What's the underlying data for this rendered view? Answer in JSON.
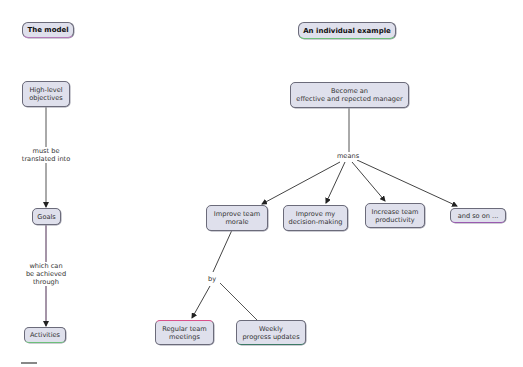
{
  "diagram": {
    "type": "concept-map",
    "sections": {
      "model": {
        "title": "The model"
      },
      "example": {
        "title": "An individual example"
      }
    },
    "nodes": {
      "high_level_objectives": "High-level\nobjectives",
      "goals": "Goals",
      "activities": "Activities",
      "root_goal": "Become an\neffective and repected manager",
      "improve_morale": "Improve team\nmorale",
      "improve_decision": "Improve my\ndecision-making",
      "increase_productivity": "Increase team\nproductivity",
      "and_so_on": "and so on ...",
      "regular_meetings": "Regular team\nmeetings",
      "weekly_updates": "Weekly\nprogress updates"
    },
    "linking_phrases": {
      "translated": "must be\ntranslated into",
      "achieved": "which can\nbe achieved\nthrough",
      "means": "means",
      "by": "by"
    },
    "edges": [
      {
        "from": "High-level objectives",
        "label": "must be translated into",
        "to": "Goals"
      },
      {
        "from": "Goals",
        "label": "which can be achieved through",
        "to": "Activities"
      },
      {
        "from": "Become an effective and repected manager",
        "label": "means",
        "to": "Improve team morale"
      },
      {
        "from": "Become an effective and repected manager",
        "label": "means",
        "to": "Improve my decision-making"
      },
      {
        "from": "Become an effective and repected manager",
        "label": "means",
        "to": "Increase team productivity"
      },
      {
        "from": "Become an effective and repected manager",
        "label": "means",
        "to": "and so on ..."
      },
      {
        "from": "Improve team morale",
        "label": "by",
        "to": "Regular team meetings"
      },
      {
        "from": "Improve team morale",
        "label": "by",
        "to": "Weekly progress updates"
      }
    ],
    "colors": {
      "node_fill": "#dfe0ec",
      "node_border": "#6b6b7a",
      "edge": "#444444",
      "accent_green": "#6cc07a",
      "accent_pink": "#d9508a",
      "accent_purple": "#7a3a8a"
    }
  }
}
